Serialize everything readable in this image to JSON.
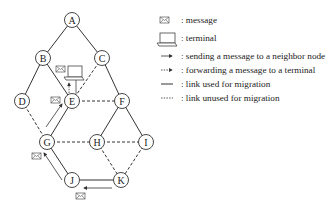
{
  "nodes": [
    {
      "id": "A",
      "x": 72,
      "y": 20
    },
    {
      "id": "B",
      "x": 43,
      "y": 58
    },
    {
      "id": "C",
      "x": 102,
      "y": 58
    },
    {
      "id": "D",
      "x": 22,
      "y": 101
    },
    {
      "id": "E",
      "x": 72,
      "y": 101
    },
    {
      "id": "F",
      "x": 122,
      "y": 101
    },
    {
      "id": "G",
      "x": 47,
      "y": 142
    },
    {
      "id": "H",
      "x": 97,
      "y": 142
    },
    {
      "id": "I",
      "x": 146,
      "y": 142
    },
    {
      "id": "J",
      "x": 72,
      "y": 180
    },
    {
      "id": "K",
      "x": 121,
      "y": 180
    }
  ],
  "edges": [
    {
      "from": "A",
      "to": "B",
      "style": "solid"
    },
    {
      "from": "A",
      "to": "C",
      "style": "solid"
    },
    {
      "from": "B",
      "to": "D",
      "style": "solid"
    },
    {
      "from": "B",
      "to": "E",
      "style": "solid"
    },
    {
      "from": "C",
      "to": "F",
      "style": "solid"
    },
    {
      "from": "C",
      "to": "E",
      "style": "dashed"
    },
    {
      "from": "E",
      "to": "F",
      "style": "dashed"
    },
    {
      "from": "D",
      "to": "G",
      "style": "dashed"
    },
    {
      "from": "E",
      "to": "G",
      "style": "solid"
    },
    {
      "from": "F",
      "to": "H",
      "style": "solid"
    },
    {
      "from": "F",
      "to": "I",
      "style": "solid"
    },
    {
      "from": "G",
      "to": "H",
      "style": "dashed"
    },
    {
      "from": "H",
      "to": "I",
      "style": "dashed"
    },
    {
      "from": "G",
      "to": "J",
      "style": "solid"
    },
    {
      "from": "H",
      "to": "K",
      "style": "dashed"
    },
    {
      "from": "I",
      "to": "K",
      "style": "dashed"
    },
    {
      "from": "J",
      "to": "K",
      "style": "solid"
    }
  ],
  "legend": {
    "message": ": message",
    "terminal": ": terminal",
    "sending": ": sending a message to a neighbor node",
    "forwarding": ": forwarding a message to a terminal",
    "used": ": link used for migration",
    "unused": ": link unused for migration"
  },
  "colors": {
    "line": "#333333",
    "node_fill": "#ffffff",
    "text": "#222222"
  }
}
